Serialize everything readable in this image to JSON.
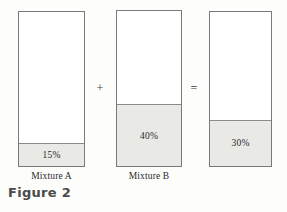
{
  "figure": {
    "caption": "Figure 2",
    "background_color": "#fdfdfb",
    "border_color": "#7a7a78",
    "fill_color": "#e9e9e6",
    "text_color": "#2b2b2b"
  },
  "columns": [
    {
      "id": "a",
      "caption": "Mixture A",
      "fill_label": "15%",
      "fill_percent": 15
    },
    {
      "id": "b",
      "caption": "Mixture B",
      "fill_label": "40%",
      "fill_percent": 40
    },
    {
      "id": "c",
      "caption": "",
      "fill_label": "30%",
      "fill_percent": 30
    }
  ],
  "operators": {
    "plus": "+",
    "equals": "="
  },
  "chart_data": {
    "type": "bar",
    "title": "Figure 2",
    "categories": [
      "Mixture A",
      "Mixture B",
      ""
    ],
    "values": [
      15,
      40,
      30
    ],
    "data_labels": [
      "15%",
      "40%",
      "30%"
    ],
    "ylabel": "",
    "xlabel": "",
    "ylim": [
      0,
      100
    ],
    "grid": false,
    "legend": null,
    "annotations": [
      "+",
      "="
    ]
  }
}
